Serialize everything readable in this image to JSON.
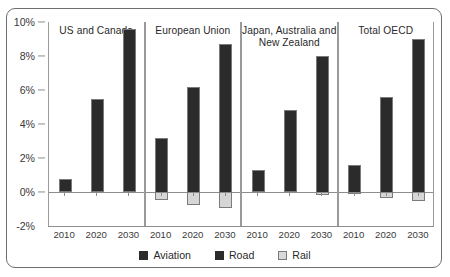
{
  "chart_data": {
    "type": "bar",
    "stacked": true,
    "title": "",
    "subtitle": "",
    "xlabel": "",
    "ylabel": "",
    "ylim": [
      -2,
      10
    ],
    "grid": false,
    "legend_position": "bottom",
    "y_tick_labels": [
      "10%",
      "8%",
      "6%",
      "4%",
      "2%",
      "0%",
      "-2%"
    ],
    "y_tick_values": [
      10,
      8,
      6,
      4,
      2,
      0,
      -2
    ],
    "categories": [
      "2010",
      "2020",
      "2030"
    ],
    "legend": [
      {
        "name": "Aviation",
        "color": "#2b2b2b"
      },
      {
        "name": "Road",
        "color": "#2b2b2b"
      },
      {
        "name": "Rail",
        "color": "#d6d6d6"
      }
    ],
    "panels": [
      {
        "label": "US and Canada",
        "categories": [
          "2010",
          "2020",
          "2030"
        ],
        "series": [
          {
            "name": "Aviation",
            "values": [
              0.75,
              0.0,
              0.0
            ]
          },
          {
            "name": "Road",
            "values": [
              0.0,
              5.5,
              9.6
            ]
          },
          {
            "name": "Rail",
            "values": [
              0.0,
              0.0,
              0.0
            ]
          }
        ]
      },
      {
        "label": "European Union",
        "categories": [
          "2010",
          "2020",
          "2030"
        ],
        "series": [
          {
            "name": "Aviation",
            "values": [
              0.85,
              1.65,
              2.15
            ]
          },
          {
            "name": "Road",
            "values": [
              2.35,
              4.55,
              6.55
            ]
          },
          {
            "name": "Rail",
            "values": [
              -0.45,
              -0.75,
              -0.95
            ]
          }
        ]
      },
      {
        "label": "Japan, Australia and New Zealand",
        "categories": [
          "2010",
          "2020",
          "2030"
        ],
        "series": [
          {
            "name": "Aviation",
            "values": [
              1.3,
              0.0,
              0.1
            ]
          },
          {
            "name": "Road",
            "values": [
              0.0,
              4.8,
              7.9
            ]
          },
          {
            "name": "Rail",
            "values": [
              0.0,
              0.0,
              -0.2
            ]
          }
        ]
      },
      {
        "label": "Total OECD",
        "categories": [
          "2010",
          "2020",
          "2030"
        ],
        "series": [
          {
            "name": "Aviation",
            "values": [
              0.25,
              0.35,
              0.4
            ]
          },
          {
            "name": "Road",
            "values": [
              1.35,
              5.25,
              8.6
            ]
          },
          {
            "name": "Rail",
            "values": [
              -0.1,
              -0.35,
              -0.5
            ]
          }
        ]
      }
    ]
  }
}
